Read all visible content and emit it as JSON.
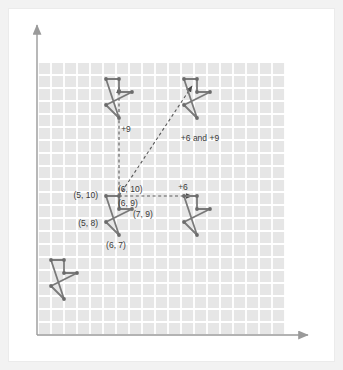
{
  "figure": {
    "background_color": "#f2f2f2",
    "panel_color": "#ffffff",
    "grid_fill": "#e6e6e6",
    "grid_line_color": "#ffffff",
    "axis_color": "#8c8c8c",
    "shape_stroke": "#7a7a7a",
    "vertex_color": "#6b6b6b",
    "dash_color": "#5a5a5a",
    "label_color": "#3a3a3a"
  },
  "axes": {
    "x_axis_name": "x-axis",
    "y_axis_name": "y-axis",
    "x_arrow": "arrow-right",
    "y_arrow": "arrow-up",
    "grid_cells_x": 19,
    "grid_cells_y": 21,
    "cell_size_px": 13
  },
  "vertex_labels": [
    {
      "text": "(5, 10)",
      "anchor": "end",
      "x": 98,
      "y": 198
    },
    {
      "text": "(6, 10)",
      "anchor": "start",
      "x": 118,
      "y": 192
    },
    {
      "text": "(6, 9)",
      "anchor": "start",
      "x": 118,
      "y": 206
    },
    {
      "text": "(7, 9)",
      "anchor": "start",
      "x": 133,
      "y": 217
    },
    {
      "text": "(5, 8)",
      "anchor": "end",
      "x": 98,
      "y": 226
    },
    {
      "text": "(6, 7)",
      "anchor": "middle",
      "x": 116,
      "y": 248
    }
  ],
  "translation_labels": [
    {
      "text": "+9",
      "name": "translation-label-vertical",
      "x": 126,
      "y": 132
    },
    {
      "text": "+6 and +9",
      "name": "translation-label-diagonal",
      "x": 200,
      "y": 141
    },
    {
      "text": "+6",
      "name": "translation-label-horizontal",
      "x": 183,
      "y": 190
    }
  ],
  "shapes": [
    {
      "name": "original-shape",
      "points": "106,196 119,196 119,209 132,209 106,222 119,235",
      "vertices": [
        [
          106,
          196
        ],
        [
          119,
          196
        ],
        [
          119,
          209
        ],
        [
          132,
          209
        ],
        [
          106,
          222
        ],
        [
          119,
          235
        ]
      ]
    },
    {
      "name": "translated-up-shape",
      "points": "106,79 119,79 119,92 132,92 106,105 119,118",
      "vertices": [
        [
          106,
          79
        ],
        [
          119,
          79
        ],
        [
          119,
          92
        ],
        [
          132,
          92
        ],
        [
          106,
          105
        ],
        [
          119,
          118
        ]
      ]
    },
    {
      "name": "translated-diagonal-shape",
      "points": "184,79 197,79 197,92 210,92 184,105 197,118",
      "vertices": [
        [
          184,
          79
        ],
        [
          197,
          79
        ],
        [
          197,
          92
        ],
        [
          210,
          92
        ],
        [
          184,
          105
        ],
        [
          197,
          118
        ]
      ]
    },
    {
      "name": "translated-right-shape",
      "points": "184,196 197,196 197,209 210,209 184,222 197,235",
      "vertices": [
        [
          184,
          196
        ],
        [
          197,
          196
        ],
        [
          197,
          209
        ],
        [
          210,
          209
        ],
        [
          184,
          222
        ],
        [
          197,
          235
        ]
      ]
    },
    {
      "name": "lower-left-shape",
      "points": "51,260 64,260 64,273 77,273 51,286 64,299",
      "vertices": [
        [
          51,
          260
        ],
        [
          64,
          260
        ],
        [
          64,
          273
        ],
        [
          77,
          273
        ],
        [
          51,
          286
        ],
        [
          64,
          299
        ]
      ]
    }
  ],
  "arrows": [
    {
      "name": "translation-arrow-vertical",
      "x1": 119,
      "y1": 196,
      "x2": 119,
      "y2": 87
    },
    {
      "name": "translation-arrow-diagonal",
      "x1": 119,
      "y1": 196,
      "x2": 192,
      "y2": 86
    },
    {
      "name": "translation-arrow-horizontal",
      "x1": 119,
      "y1": 196,
      "x2": 192,
      "y2": 196
    }
  ]
}
